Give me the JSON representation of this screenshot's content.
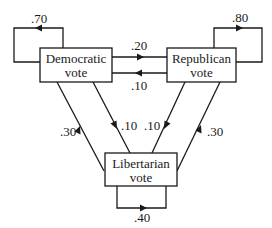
{
  "diagram": {
    "type": "state-transition",
    "nodes": [
      {
        "id": "democratic",
        "label_line1": "Democratic",
        "label_line2": "vote"
      },
      {
        "id": "republican",
        "label_line1": "Republican",
        "label_line2": "vote"
      },
      {
        "id": "libertarian",
        "label_line1": "Libertarian",
        "label_line2": "vote"
      }
    ],
    "edges": [
      {
        "from": "democratic",
        "to": "democratic",
        "label": ".70"
      },
      {
        "from": "republican",
        "to": "republican",
        "label": ".80"
      },
      {
        "from": "libertarian",
        "to": "libertarian",
        "label": ".40"
      },
      {
        "from": "democratic",
        "to": "republican",
        "label": ".20"
      },
      {
        "from": "republican",
        "to": "democratic",
        "label": ".10"
      },
      {
        "from": "libertarian",
        "to": "democratic",
        "label": ".30"
      },
      {
        "from": "democratic",
        "to": "libertarian",
        "label": ".10"
      },
      {
        "from": "republican",
        "to": "libertarian",
        "label": ".10"
      },
      {
        "from": "libertarian",
        "to": "republican",
        "label": ".30"
      }
    ]
  },
  "colors": {
    "stroke": "#1a1a1a",
    "background": "#ffffff"
  }
}
